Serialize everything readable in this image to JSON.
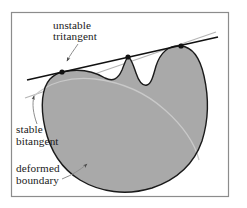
{
  "figure": {
    "frame": {
      "border_color": "#8c8c8c",
      "background_color": "#ffffff"
    },
    "colors": {
      "shape_fill": "#a9a9a9",
      "shape_outline": "#1a1a1a",
      "tritangent_line": "#111111",
      "bitangent_line": "#b5b5b5",
      "original_boundary": "#c9c9c9",
      "leader_line": "#8f8f8f",
      "text": "#1a1a1a",
      "tangent_point": "#111111"
    },
    "annotations": [
      {
        "name": "unstable-tritangent",
        "lines": [
          "unstable",
          "tritangent"
        ],
        "line1": "unstable",
        "line2": "tritangent",
        "x": 53,
        "y1": 29,
        "y2": 40,
        "leader": "M 78 44 C 74 50, 70 55, 67 61"
      },
      {
        "name": "stable-bitangent",
        "lines": [
          "stable",
          "bitangent"
        ],
        "line1": "stable",
        "line2": "bitangent",
        "x": 16,
        "y1": 133,
        "y2": 145,
        "leader": "M 37 124 C 33 113, 32 104, 34 96"
      },
      {
        "name": "deformed-boundary",
        "lines": [
          "deformed",
          "boundary"
        ],
        "line1": "deformed",
        "line2": "boundary",
        "x": 16,
        "y1": 172,
        "y2": 184,
        "leader": "M 62 179 C 72 175, 80 170, 87 164"
      }
    ],
    "tangent_points": [
      {
        "name": "left-tangent-point",
        "x": 62,
        "y": 72,
        "r": 2.6
      },
      {
        "name": "middle-tangent-point",
        "x": 128,
        "y": 57,
        "r": 2.6
      },
      {
        "name": "right-tangent-point",
        "x": 181,
        "y": 46,
        "r": 2.6
      }
    ],
    "lines": {
      "tritangent": {
        "x1": 27,
        "y1": 80,
        "x2": 218,
        "y2": 37,
        "width": 1.5
      },
      "bitangent": {
        "x1": 25,
        "y1": 98,
        "x2": 216,
        "y2": 32,
        "width": 1.2
      }
    },
    "paths": {
      "deformed_boundary": "M 62 72 C 80 68, 95 72, 105 78 C 113 82, 118 79, 122 70 C 125 62, 127 57, 128 57 C 130 57, 133 64, 136 73 C 139 82, 143 86, 147 85 C 151 84, 153 77, 156 66 C 161 51, 170 45, 181 46 C 192 47, 200 58, 204 76 C 209 98, 209 119, 202 141 C 194 164, 176 180, 152 188 C 126 196, 100 192, 80 180 C 62 169, 50 150, 45 128 C 40 106, 42 88, 50 79 C 54 75, 58 73, 62 72 Z",
      "original_boundary": "M 34 96 C 48 83, 70 76, 95 79 C 120 82, 145 92, 165 110 C 183 126, 195 144, 199 160"
    }
  }
}
